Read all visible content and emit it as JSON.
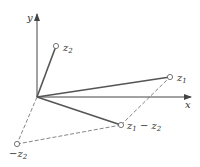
{
  "diagram": {
    "axes": {
      "x_label": "x",
      "y_label": "y"
    },
    "points": {
      "z1": {
        "label": "z",
        "sub": "1"
      },
      "z2": {
        "label": "z",
        "sub": "2"
      },
      "neg_z2": {
        "label": "−z",
        "sub": "2"
      },
      "diff": {
        "label": "z",
        "sub1": "1",
        "minus": " − z",
        "sub2": "2"
      }
    },
    "colors": {
      "line": "#555555",
      "dashed": "#666666",
      "text": "#333333"
    }
  }
}
